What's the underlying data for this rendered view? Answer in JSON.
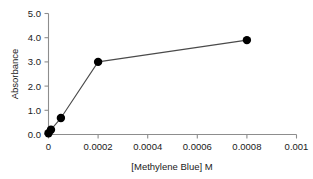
{
  "chart_data": {
    "type": "line",
    "title": "",
    "subtitle": "",
    "xlabel": "[Methylene Blue] M",
    "ylabel": "Absorbance",
    "xlim": [
      0,
      0.001
    ],
    "ylim": [
      0,
      5.0
    ],
    "grid": false,
    "legend": null,
    "marker": "filled-circle",
    "marker_color": "#000000",
    "line_color": "#4a4a4a",
    "xticks": [
      0,
      0.0002,
      0.0004,
      0.0006,
      0.0008,
      0.001
    ],
    "xtick_labels": [
      "0",
      "0.0002",
      "0.0004",
      "0.0006",
      "0.0008",
      "0.001"
    ],
    "yticks": [
      0,
      1,
      2,
      3,
      4,
      5
    ],
    "ytick_labels": [
      "0.0",
      "1.0",
      "2.0",
      "3.0",
      "4.0",
      "5.0"
    ],
    "x": [
      0.0,
      1e-05,
      5e-05,
      0.0002,
      0.0008
    ],
    "y": [
      0.05,
      0.2,
      0.68,
      3.0,
      3.9
    ],
    "series": [
      {
        "name": "Absorbance vs [Methylene Blue]",
        "points": [
          {
            "x": 0.0,
            "y": 0.05
          },
          {
            "x": 1e-05,
            "y": 0.2
          },
          {
            "x": 5e-05,
            "y": 0.68
          },
          {
            "x": 0.0002,
            "y": 3.0
          },
          {
            "x": 0.0008,
            "y": 3.9
          }
        ]
      }
    ]
  },
  "axes": {
    "y_title": "Absorbance",
    "x_title": "[Methylene Blue] M",
    "y_tick_0": "0.0",
    "y_tick_1": "1.0",
    "y_tick_2": "2.0",
    "y_tick_3": "3.0",
    "y_tick_4": "4.0",
    "y_tick_5": "5.0",
    "x_tick_0": "0",
    "x_tick_1": "0.0002",
    "x_tick_2": "0.0004",
    "x_tick_3": "0.0006",
    "x_tick_4": "0.0008",
    "x_tick_5": "0.001"
  },
  "colors": {
    "background": "#ffffff",
    "axis": "#8d8d8d",
    "marker": "#000000",
    "line": "#4a4a4a",
    "text": "#1a1a1a"
  }
}
